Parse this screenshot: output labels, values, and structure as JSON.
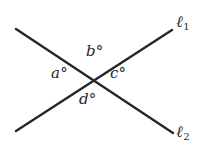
{
  "figure": {
    "background_color": "#ffffff",
    "stroke_color": "#26262b",
    "stroke_width": 2.4,
    "width": 209,
    "height": 159
  },
  "lines": [
    {
      "id": "l1",
      "label": "ℓ",
      "subscript": "1",
      "x1": 16,
      "y1": 131,
      "x2": 172,
      "y2": 30
    },
    {
      "id": "l2",
      "label": "ℓ",
      "subscript": "2",
      "x1": 16,
      "y1": 29,
      "x2": 173,
      "y2": 133
    }
  ],
  "intersection": {
    "x": 95,
    "y": 78
  },
  "angles": [
    {
      "id": "a",
      "text": "a°",
      "position": "left"
    },
    {
      "id": "b",
      "text": "b°",
      "position": "top"
    },
    {
      "id": "c",
      "text": "c°",
      "position": "right"
    },
    {
      "id": "d",
      "text": "d°",
      "position": "bottom"
    }
  ]
}
